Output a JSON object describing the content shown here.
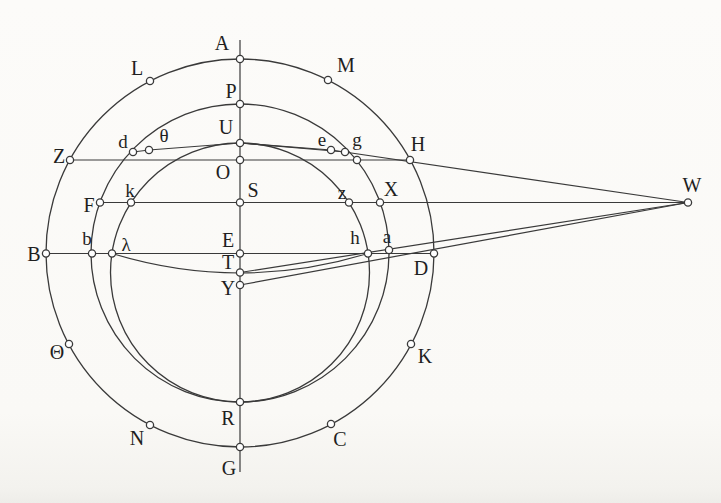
{
  "figure": {
    "background": "#fbfaf7",
    "ink_color": "#3a3a3a",
    "label_color": "#1f1f1f",
    "marker_fill": "#ffffff",
    "marker_radius": 3.6,
    "circles": [
      {
        "name": "outer-circle",
        "cx": 240,
        "cy": 253,
        "r": 194
      },
      {
        "name": "middle-circle",
        "cx": 240,
        "cy": 253,
        "r": 149
      },
      {
        "name": "inner-circle",
        "cx": 240,
        "cy": 272.5,
        "r": 129.5
      }
    ],
    "lines": [
      {
        "name": "apsidal-line-A-G",
        "pts": [
          [
            240,
            40
          ],
          [
            240,
            472
          ]
        ]
      },
      {
        "name": "chord-Z-H",
        "pts": [
          [
            69,
            160
          ],
          [
            411,
            160
          ]
        ]
      },
      {
        "name": "line-F-S-X-W",
        "pts": [
          [
            100,
            202.5
          ],
          [
            688,
            202.5
          ]
        ]
      },
      {
        "name": "chord-B-D",
        "pts": [
          [
            46,
            253.5
          ],
          [
            434,
            253.5
          ]
        ]
      },
      {
        "name": "chord-U-theta-d",
        "pts": [
          [
            133,
            152
          ],
          [
            149,
            150
          ],
          [
            240,
            143
          ]
        ]
      },
      {
        "name": "chord-U-e",
        "pts": [
          [
            240,
            143
          ],
          [
            331,
            150
          ]
        ]
      },
      {
        "name": "chord-U-g",
        "pts": [
          [
            240,
            143
          ],
          [
            345,
            152
          ]
        ]
      },
      {
        "name": "line-e-g-H-W",
        "pts": [
          [
            331,
            150
          ],
          [
            688,
            202.5
          ]
        ]
      },
      {
        "name": "line-T-W",
        "pts": [
          [
            240,
            272.5
          ],
          [
            688,
            202.5
          ]
        ]
      },
      {
        "name": "line-Y-W",
        "pts": [
          [
            240,
            285
          ],
          [
            688,
            202.5
          ]
        ]
      }
    ],
    "curves": [
      {
        "name": "arc-lambda-T-h",
        "path": "M 112 253.5 Q 240 292.5 368 253.5"
      }
    ],
    "points": [
      {
        "label": "A",
        "x": 240,
        "y": 59,
        "lx": 222,
        "ly": 44,
        "size": 20
      },
      {
        "label": "L",
        "x": 150,
        "y": 81,
        "lx": 137,
        "ly": 69,
        "size": 20
      },
      {
        "label": "M",
        "x": 328,
        "y": 80,
        "lx": 346,
        "ly": 66,
        "size": 20
      },
      {
        "label": "P",
        "x": 240,
        "y": 104,
        "lx": 231,
        "ly": 92,
        "size": 20
      },
      {
        "label": "U",
        "x": 240,
        "y": 143,
        "lx": 226,
        "ly": 128,
        "size": 20
      },
      {
        "label": "d",
        "x": 133,
        "y": 152,
        "lx": 123,
        "ly": 142,
        "size": 19
      },
      {
        "label": "θ",
        "x": 149,
        "y": 150,
        "lx": 164,
        "ly": 136,
        "size": 19
      },
      {
        "label": "e",
        "x": 331,
        "y": 150,
        "lx": 322,
        "ly": 140,
        "size": 19
      },
      {
        "label": "g",
        "x": 345,
        "y": 152,
        "lx": 357,
        "ly": 140,
        "size": 19
      },
      {
        "label": "Z",
        "x": 70,
        "y": 160,
        "lx": 59,
        "ly": 157,
        "size": 20
      },
      {
        "label": "H",
        "x": 410,
        "y": 160,
        "lx": 418,
        "ly": 145,
        "size": 20
      },
      {
        "label": "O",
        "x": 240,
        "y": 160,
        "lx": 223,
        "ly": 173,
        "size": 20
      },
      {
        "label": "F",
        "x": 100,
        "y": 202.5,
        "lx": 89,
        "ly": 206,
        "size": 20
      },
      {
        "label": "k",
        "x": 131,
        "y": 202.5,
        "lx": 130,
        "ly": 191,
        "size": 19
      },
      {
        "label": "S",
        "x": 240,
        "y": 202.5,
        "lx": 253,
        "ly": 191,
        "size": 20
      },
      {
        "label": "z",
        "x": 349,
        "y": 202.5,
        "lx": 342,
        "ly": 193,
        "size": 19
      },
      {
        "label": "X",
        "x": 380,
        "y": 202.5,
        "lx": 391,
        "ly": 190,
        "size": 20
      },
      {
        "label": "W",
        "x": 688,
        "y": 202.5,
        "lx": 692,
        "ly": 186,
        "size": 20
      },
      {
        "label": "B",
        "x": 46,
        "y": 253.5,
        "lx": 34,
        "ly": 255,
        "size": 20
      },
      {
        "label": "b",
        "x": 92,
        "y": 253.5,
        "lx": 87,
        "ly": 239,
        "size": 19
      },
      {
        "label": "λ",
        "x": 112,
        "y": 253.5,
        "lx": 126,
        "ly": 245,
        "size": 19
      },
      {
        "label": "E",
        "x": 240,
        "y": 253.5,
        "lx": 228,
        "ly": 241,
        "size": 20
      },
      {
        "label": "h",
        "x": 368,
        "y": 253.5,
        "lx": 355,
        "ly": 238,
        "size": 19
      },
      {
        "label": "a",
        "x": 389,
        "y": 250,
        "lx": 387,
        "ly": 237,
        "size": 19
      },
      {
        "label": "D",
        "x": 434,
        "y": 253.5,
        "lx": 421,
        "ly": 269,
        "size": 20
      },
      {
        "label": "T",
        "x": 240,
        "y": 272.5,
        "lx": 228,
        "ly": 263,
        "size": 20
      },
      {
        "label": "Y",
        "x": 240,
        "y": 285,
        "lx": 228,
        "ly": 289,
        "size": 20
      },
      {
        "label": "Θ",
        "x": 69,
        "y": 344,
        "lx": 57,
        "ly": 353,
        "size": 20
      },
      {
        "label": "K",
        "x": 411,
        "y": 344,
        "lx": 425,
        "ly": 357,
        "size": 20
      },
      {
        "label": "R",
        "x": 240,
        "y": 402,
        "lx": 228,
        "ly": 419,
        "size": 20
      },
      {
        "label": "N",
        "x": 150,
        "y": 425,
        "lx": 137,
        "ly": 439,
        "size": 20
      },
      {
        "label": "C",
        "x": 331,
        "y": 424,
        "lx": 340,
        "ly": 440,
        "size": 20
      },
      {
        "label": "G",
        "x": 240,
        "y": 447,
        "lx": 229,
        "ly": 469,
        "size": 20
      }
    ],
    "unlabeled_points": [
      {
        "name": "crossing-middle-circle-ZH-right",
        "x": 357,
        "y": 160
      }
    ]
  }
}
